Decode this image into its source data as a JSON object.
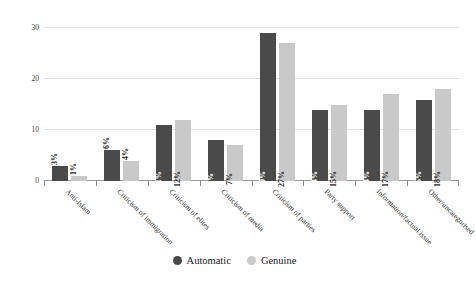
{
  "chart_data": {
    "type": "bar",
    "title": "",
    "xlabel": "",
    "ylabel": "Proportion of message, %",
    "ylim": [
      0,
      32
    ],
    "yticks": [
      0,
      10,
      20,
      30
    ],
    "ytick_labels": [
      "0",
      "10",
      "20",
      "30"
    ],
    "grid": true,
    "legend_position": "bottom",
    "categories": [
      "Anti-Islam",
      "Criticism of immigration",
      "Criticism of elites",
      "Criticism of media",
      "Criticism of parties",
      "Party support",
      "Information/factual issue",
      "Other/uncategorised"
    ],
    "series": [
      {
        "name": "Automatic",
        "color": "#4a4a4a",
        "values": [
          3,
          6,
          11,
          8,
          29,
          14,
          14,
          16
        ],
        "labels": [
          "3%",
          "6%",
          "11%",
          "8%",
          "29%",
          "14%",
          "14%",
          "16%"
        ]
      },
      {
        "name": "Genuine",
        "color": "#c9c9c9",
        "values": [
          1,
          4,
          12,
          7,
          27,
          15,
          17,
          18
        ],
        "labels": [
          "1%",
          "4%",
          "12%",
          "7%",
          "27%",
          "15%",
          "17%",
          "18%"
        ]
      }
    ]
  },
  "legend": {
    "items": [
      {
        "label": "Automatic"
      },
      {
        "label": "Genuine"
      }
    ]
  }
}
